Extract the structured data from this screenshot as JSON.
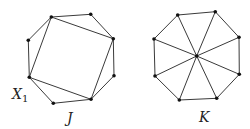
{
  "figures": [
    {
      "id": "J",
      "label": "J",
      "label_pos": [
        67,
        123
      ],
      "vertices": [
        [
          51.3,
          17
        ],
        [
          90.7,
          14.3
        ],
        [
          113.3,
          38.7
        ],
        [
          114,
          75.7
        ],
        [
          91,
          99.3
        ],
        [
          53.3,
          103.3
        ],
        [
          29.3,
          77.3
        ],
        [
          28.3,
          40.3
        ]
      ],
      "edges": [
        [
          0,
          1
        ],
        [
          1,
          2
        ],
        [
          2,
          3
        ],
        [
          3,
          4
        ],
        [
          4,
          5
        ],
        [
          5,
          6
        ],
        [
          6,
          7
        ],
        [
          7,
          0
        ],
        [
          0,
          2
        ],
        [
          2,
          4
        ],
        [
          4,
          6
        ],
        [
          6,
          0
        ]
      ],
      "vertex_label": {
        "text": "X",
        "subscript": "1",
        "pos": [
          12,
          99
        ],
        "sub_pos": [
          22,
          102
        ]
      }
    },
    {
      "id": "K",
      "label": "K",
      "label_pos": [
        199,
        122
      ],
      "center": [
        196.7,
        56
      ],
      "vertices": [
        [
          177.7,
          15
        ],
        [
          215.3,
          11.7
        ],
        [
          239,
          37.3
        ],
        [
          239.3,
          74.3
        ],
        [
          216.7,
          98.3
        ],
        [
          179.3,
          100
        ],
        [
          155,
          76
        ],
        [
          154,
          39
        ]
      ],
      "edges": [
        [
          0,
          1
        ],
        [
          1,
          2
        ],
        [
          2,
          3
        ],
        [
          3,
          4
        ],
        [
          4,
          5
        ],
        [
          5,
          6
        ],
        [
          6,
          7
        ],
        [
          7,
          0
        ]
      ],
      "spokes_to_center": true
    }
  ],
  "colors": {
    "edge": "#3a3a3a",
    "vertex": "#111111",
    "text": "#222222"
  }
}
